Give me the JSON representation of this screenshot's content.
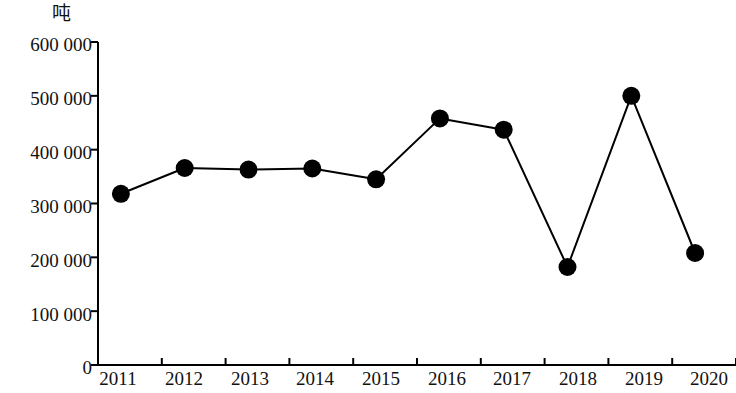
{
  "chart_data": {
    "type": "line",
    "title": "",
    "subtitle": "",
    "xlabel": "",
    "ylabel": "吨",
    "unit_caption": "吨",
    "categories": [
      "2011",
      "2012",
      "2013",
      "2014",
      "2015",
      "2016",
      "2017",
      "2018",
      "2019",
      "2020"
    ],
    "values": [
      318000,
      366000,
      363000,
      365000,
      345000,
      458000,
      437000,
      182000,
      500000,
      208000
    ],
    "series": [
      {
        "name": "吨",
        "values": [
          318000,
          366000,
          363000,
          365000,
          345000,
          458000,
          437000,
          182000,
          500000,
          208000
        ]
      }
    ],
    "ylim": [
      0,
      600000
    ],
    "ytick_values": [
      0,
      100000,
      200000,
      300000,
      400000,
      500000,
      600000
    ],
    "ytick_labels": [
      "0",
      "100 000",
      "200 000",
      "300 000",
      "400 000",
      "500 000",
      "600 000"
    ],
    "xtick_labels": [
      "2011",
      "2012",
      "2013",
      "2014",
      "2015",
      "2016",
      "2017",
      "2018",
      "2019",
      "2020"
    ],
    "grid": false,
    "legend": false,
    "legend_position": "none",
    "marker": "filled-circle",
    "line_color": "#000000",
    "marker_color": "#000000",
    "axis_color": "#000000",
    "background_color": "#ffffff",
    "annotations": []
  },
  "axes": {
    "y_unit_label": "吨",
    "y_labels": [
      "600 000",
      "500 000",
      "400 000",
      "300 000",
      "200 000",
      "100 000",
      "0"
    ],
    "x_labels": [
      "2011",
      "2012",
      "2013",
      "2014",
      "2015",
      "2016",
      "2017",
      "2018",
      "2019",
      "2020"
    ]
  }
}
